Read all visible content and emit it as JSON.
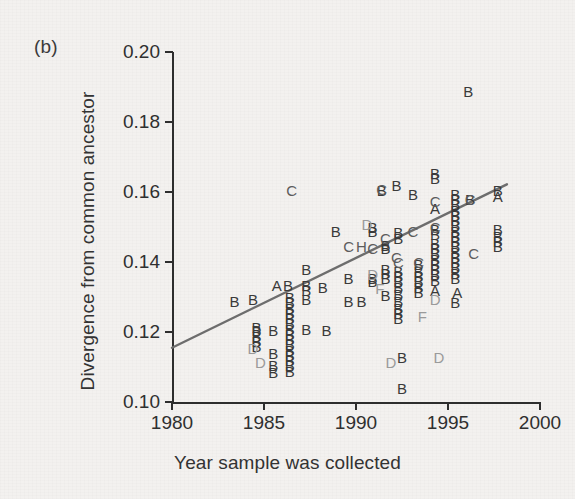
{
  "panel": {
    "label": "(b)"
  },
  "axes": {
    "xlabel": "Year sample was collected",
    "ylabel": "Divergence from common ancestor",
    "xticks": [
      "1980",
      "1985",
      "1990",
      "1995",
      "2000"
    ],
    "yticks": [
      "0.10",
      "0.12",
      "0.14",
      "0.16",
      "0.18",
      "0.20"
    ]
  },
  "colors": {
    "axis": "#2e2e2e",
    "text": "#2f2f2f",
    "trendline": "#6d6d6d",
    "marker_dark": "#3a3a3a",
    "marker_mid": "#5c5c5c",
    "marker_light": "#9a9a9a"
  },
  "chart_data": {
    "type": "scatter",
    "title": "",
    "subtitle": "",
    "xlabel": "Year sample was collected",
    "ylabel": "Divergence from common ancestor",
    "xlim": [
      1980,
      2000
    ],
    "ylim": [
      0.1,
      0.2
    ],
    "xticks": [
      1980,
      1985,
      1990,
      1995,
      2000
    ],
    "yticks": [
      0.1,
      0.12,
      0.14,
      0.16,
      0.18,
      0.2
    ],
    "grid": false,
    "legend": "none",
    "marker_style": "letter-glyph-subtype",
    "annotations": [
      "(b)"
    ],
    "trendline": {
      "type": "linear-regression",
      "x": [
        1980,
        1998.2
      ],
      "y": [
        0.1155,
        0.1622
      ],
      "slope_per_year": 0.00257,
      "color": "#6d6d6d"
    },
    "series": [
      {
        "name": "Subtype A",
        "label": "A",
        "shade": "dark",
        "points": [
          {
            "x": 1985.7,
            "y": 0.1335
          },
          {
            "x": 1994.3,
            "y": 0.1555
          },
          {
            "x": 1994.3,
            "y": 0.132
          },
          {
            "x": 1995.5,
            "y": 0.1315
          },
          {
            "x": 1997.7,
            "y": 0.159
          }
        ]
      },
      {
        "name": "Subtype B",
        "label": "B",
        "shade": "dark",
        "points": [
          {
            "x": 1983.4,
            "y": 0.129
          },
          {
            "x": 1984.4,
            "y": 0.1295
          },
          {
            "x": 1986.3,
            "y": 0.1335
          },
          {
            "x": 1984.6,
            "y": 0.1215
          },
          {
            "x": 1984.6,
            "y": 0.1205
          },
          {
            "x": 1984.6,
            "y": 0.119
          },
          {
            "x": 1984.6,
            "y": 0.1175
          },
          {
            "x": 1984.6,
            "y": 0.116
          },
          {
            "x": 1985.5,
            "y": 0.1205
          },
          {
            "x": 1985.5,
            "y": 0.114
          },
          {
            "x": 1985.5,
            "y": 0.1105
          },
          {
            "x": 1985.5,
            "y": 0.1085
          },
          {
            "x": 1986.4,
            "y": 0.13
          },
          {
            "x": 1986.4,
            "y": 0.1285
          },
          {
            "x": 1986.4,
            "y": 0.127
          },
          {
            "x": 1986.4,
            "y": 0.1255
          },
          {
            "x": 1986.4,
            "y": 0.124
          },
          {
            "x": 1986.4,
            "y": 0.1225
          },
          {
            "x": 1986.4,
            "y": 0.121
          },
          {
            "x": 1986.4,
            "y": 0.1195
          },
          {
            "x": 1986.4,
            "y": 0.118
          },
          {
            "x": 1986.4,
            "y": 0.1165
          },
          {
            "x": 1986.4,
            "y": 0.115
          },
          {
            "x": 1986.4,
            "y": 0.1135
          },
          {
            "x": 1986.4,
            "y": 0.112
          },
          {
            "x": 1986.4,
            "y": 0.1105
          },
          {
            "x": 1986.4,
            "y": 0.109
          },
          {
            "x": 1987.3,
            "y": 0.138
          },
          {
            "x": 1987.3,
            "y": 0.1335
          },
          {
            "x": 1987.3,
            "y": 0.132
          },
          {
            "x": 1987.3,
            "y": 0.1295
          },
          {
            "x": 1987.3,
            "y": 0.121
          },
          {
            "x": 1988.2,
            "y": 0.133
          },
          {
            "x": 1988.4,
            "y": 0.1205
          },
          {
            "x": 1988.9,
            "y": 0.149
          },
          {
            "x": 1989.6,
            "y": 0.1355
          },
          {
            "x": 1989.6,
            "y": 0.129
          },
          {
            "x": 1990.3,
            "y": 0.129
          },
          {
            "x": 1990.9,
            "y": 0.15
          },
          {
            "x": 1990.9,
            "y": 0.149
          },
          {
            "x": 1990.9,
            "y": 0.1355
          },
          {
            "x": 1990.9,
            "y": 0.1345
          },
          {
            "x": 1991.4,
            "y": 0.1605
          },
          {
            "x": 1991.6,
            "y": 0.145
          },
          {
            "x": 1991.6,
            "y": 0.144
          },
          {
            "x": 1991.6,
            "y": 0.138
          },
          {
            "x": 1991.6,
            "y": 0.137
          },
          {
            "x": 1991.6,
            "y": 0.1355
          },
          {
            "x": 1991.6,
            "y": 0.1305
          },
          {
            "x": 1992.2,
            "y": 0.162
          },
          {
            "x": 1992.3,
            "y": 0.1485
          },
          {
            "x": 1992.3,
            "y": 0.147
          },
          {
            "x": 1992.3,
            "y": 0.1375
          },
          {
            "x": 1992.3,
            "y": 0.136
          },
          {
            "x": 1992.3,
            "y": 0.1345
          },
          {
            "x": 1992.3,
            "y": 0.133
          },
          {
            "x": 1992.3,
            "y": 0.131
          },
          {
            "x": 1992.3,
            "y": 0.129
          },
          {
            "x": 1992.3,
            "y": 0.127
          },
          {
            "x": 1992.3,
            "y": 0.1255
          },
          {
            "x": 1992.3,
            "y": 0.124
          },
          {
            "x": 1992.5,
            "y": 0.113
          },
          {
            "x": 1992.5,
            "y": 0.104
          },
          {
            "x": 1993.1,
            "y": 0.1595
          },
          {
            "x": 1993.4,
            "y": 0.1395
          },
          {
            "x": 1993.4,
            "y": 0.1375
          },
          {
            "x": 1993.4,
            "y": 0.136
          },
          {
            "x": 1993.4,
            "y": 0.1345
          },
          {
            "x": 1993.4,
            "y": 0.133
          },
          {
            "x": 1993.4,
            "y": 0.1315
          },
          {
            "x": 1994.3,
            "y": 0.1655
          },
          {
            "x": 1994.3,
            "y": 0.164
          },
          {
            "x": 1994.3,
            "y": 0.1495
          },
          {
            "x": 1994.3,
            "y": 0.148
          },
          {
            "x": 1994.3,
            "y": 0.1455
          },
          {
            "x": 1994.3,
            "y": 0.144
          },
          {
            "x": 1994.3,
            "y": 0.1425
          },
          {
            "x": 1994.3,
            "y": 0.141
          },
          {
            "x": 1994.3,
            "y": 0.1395
          },
          {
            "x": 1994.3,
            "y": 0.138
          },
          {
            "x": 1994.3,
            "y": 0.1365
          },
          {
            "x": 1994.3,
            "y": 0.135
          },
          {
            "x": 1995.4,
            "y": 0.1595
          },
          {
            "x": 1995.4,
            "y": 0.158
          },
          {
            "x": 1995.4,
            "y": 0.1565
          },
          {
            "x": 1995.4,
            "y": 0.155
          },
          {
            "x": 1995.4,
            "y": 0.1535
          },
          {
            "x": 1995.4,
            "y": 0.152
          },
          {
            "x": 1995.4,
            "y": 0.1505
          },
          {
            "x": 1995.4,
            "y": 0.149
          },
          {
            "x": 1995.4,
            "y": 0.1475
          },
          {
            "x": 1995.4,
            "y": 0.146
          },
          {
            "x": 1995.4,
            "y": 0.1445
          },
          {
            "x": 1995.4,
            "y": 0.143
          },
          {
            "x": 1995.4,
            "y": 0.1415
          },
          {
            "x": 1995.4,
            "y": 0.14
          },
          {
            "x": 1995.4,
            "y": 0.1385
          },
          {
            "x": 1995.4,
            "y": 0.137
          },
          {
            "x": 1995.4,
            "y": 0.1355
          },
          {
            "x": 1995.4,
            "y": 0.1285
          },
          {
            "x": 1996.1,
            "y": 0.189
          },
          {
            "x": 1996.2,
            "y": 0.158
          },
          {
            "x": 1997.7,
            "y": 0.1605
          },
          {
            "x": 1997.7,
            "y": 0.1495
          },
          {
            "x": 1997.7,
            "y": 0.1475
          },
          {
            "x": 1997.7,
            "y": 0.146
          },
          {
            "x": 1997.7,
            "y": 0.1445
          }
        ]
      },
      {
        "name": "Subtype C",
        "label": "C",
        "shade": "mid",
        "points": [
          {
            "x": 1986.5,
            "y": 0.1605
          },
          {
            "x": 1989.6,
            "y": 0.1445
          },
          {
            "x": 1990.9,
            "y": 0.144
          },
          {
            "x": 1991.4,
            "y": 0.161
          },
          {
            "x": 1991.6,
            "y": 0.147
          },
          {
            "x": 1992.2,
            "y": 0.1415
          },
          {
            "x": 1992.3,
            "y": 0.14
          },
          {
            "x": 1993.1,
            "y": 0.149
          },
          {
            "x": 1993.4,
            "y": 0.14
          },
          {
            "x": 1994.3,
            "y": 0.1575
          },
          {
            "x": 1994.3,
            "y": 0.15
          },
          {
            "x": 1996.2,
            "y": 0.158
          },
          {
            "x": 1996.4,
            "y": 0.1425
          }
        ]
      },
      {
        "name": "Subtype D",
        "label": "D",
        "shade": "light",
        "points": [
          {
            "x": 1984.4,
            "y": 0.1155
          },
          {
            "x": 1984.8,
            "y": 0.1115
          },
          {
            "x": 1990.6,
            "y": 0.151
          },
          {
            "x": 1990.9,
            "y": 0.1365
          },
          {
            "x": 1991.9,
            "y": 0.1115
          },
          {
            "x": 1994.3,
            "y": 0.1295
          },
          {
            "x": 1994.5,
            "y": 0.113
          }
        ]
      },
      {
        "name": "Subtype F",
        "label": "F",
        "shade": "light",
        "points": [
          {
            "x": 1991.3,
            "y": 0.1325
          },
          {
            "x": 1993.6,
            "y": 0.1245
          }
        ]
      },
      {
        "name": "Subtype H",
        "label": "H",
        "shade": "mid",
        "points": [
          {
            "x": 1990.3,
            "y": 0.1445
          }
        ]
      }
    ]
  }
}
